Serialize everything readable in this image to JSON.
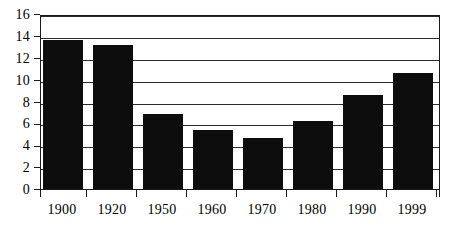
{
  "chart_data": {
    "type": "bar",
    "title": "",
    "subtitle": "",
    "xlabel": "",
    "ylabel": "",
    "categories": [
      "1900",
      "1920",
      "1950",
      "1960",
      "1970",
      "1980",
      "1990",
      "1999"
    ],
    "values": [
      13.6,
      13.2,
      6.9,
      5.4,
      4.7,
      6.2,
      8.6,
      10.6
    ],
    "series": [
      {
        "name": "",
        "values": [
          13.6,
          13.2,
          6.9,
          5.4,
          4.7,
          6.2,
          8.6,
          10.6
        ]
      }
    ],
    "ylim": [
      0,
      16
    ],
    "xlim": [
      0,
      8
    ],
    "y_ticks": [
      0,
      2,
      4,
      6,
      8,
      10,
      12,
      14,
      16
    ],
    "y_tick_labels": [
      "0",
      "2",
      "4",
      "6",
      "8",
      "10",
      "12",
      "14",
      "16"
    ],
    "x_tick_labels": [
      "1900",
      "1920",
      "1950",
      "1960",
      "1970",
      "1980",
      "1990",
      "1999"
    ],
    "grid": true,
    "grid_axis": "y",
    "legend": false,
    "legend_position": "none",
    "annotations": [],
    "colors": {
      "bar": "#0d0d0d",
      "grid": "#2b2b2b",
      "axis": "#1a1a1a",
      "background": "#ffffff",
      "text": "#000000"
    }
  }
}
